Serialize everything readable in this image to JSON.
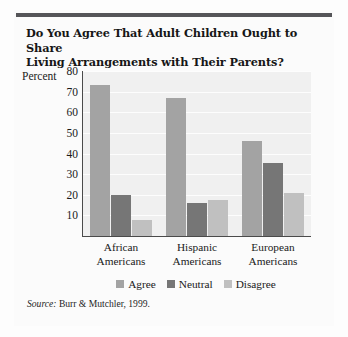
{
  "figure": {
    "title": "Do You Agree That Adult Children Ought to Share Living Arrangements with Their Parents?",
    "title_line1": "Do You Agree That Adult Children Ought to Share",
    "title_line2": "Living Arrangements with Their Parents?",
    "source_label": "Source:",
    "source_text": "Burr & Mutchler, 1999."
  },
  "chart_data": {
    "type": "bar",
    "title": "Do You Agree That Adult Children Ought to Share Living Arrangements with Their Parents?",
    "xlabel": "",
    "ylabel": "Percent",
    "ylim": [
      0,
      80
    ],
    "yticks": [
      10,
      20,
      30,
      40,
      50,
      60,
      70,
      80
    ],
    "grid": true,
    "legend_position": "bottom",
    "categories": [
      "African Americans",
      "Hispanic Americans",
      "European Americans"
    ],
    "category_lines": [
      [
        "African",
        "Americans"
      ],
      [
        "Hispanic",
        "Americans"
      ],
      [
        "European",
        "Americans"
      ]
    ],
    "series": [
      {
        "name": "Agree",
        "color": "#a3a3a3",
        "values": [
          73,
          67,
          46
        ]
      },
      {
        "name": "Neutral",
        "color": "#767676",
        "values": [
          20,
          16,
          35.5
        ]
      },
      {
        "name": "Disagree",
        "color": "#c0c0c0",
        "values": [
          8,
          17.5,
          21
        ]
      }
    ]
  },
  "colors": {
    "top_rule": "#555558",
    "plot_background": "#f0f0f0",
    "axis": "#4a4a4a",
    "gridline": "#ffffff"
  }
}
